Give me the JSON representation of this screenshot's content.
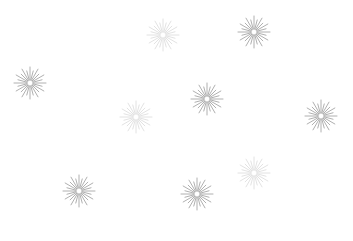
{
  "canvas": {
    "width": 353,
    "height": 241,
    "background": "#ffffff"
  },
  "starbursts": [
    {
      "id": "starburst-1",
      "cx": 30,
      "cy": 83,
      "r": 16,
      "inner": 3,
      "rays": 24,
      "color": "#8a8a8a",
      "opacity": 0.85
    },
    {
      "id": "starburst-2",
      "cx": 163,
      "cy": 35,
      "r": 16,
      "inner": 3,
      "rays": 24,
      "color": "#b0b0b0",
      "opacity": 0.45
    },
    {
      "id": "starburst-3",
      "cx": 254,
      "cy": 32,
      "r": 16,
      "inner": 3,
      "rays": 24,
      "color": "#8a8a8a",
      "opacity": 0.85
    },
    {
      "id": "starburst-4",
      "cx": 207,
      "cy": 99,
      "r": 16,
      "inner": 3,
      "rays": 24,
      "color": "#8a8a8a",
      "opacity": 0.85
    },
    {
      "id": "starburst-5",
      "cx": 136,
      "cy": 117,
      "r": 16,
      "inner": 3,
      "rays": 24,
      "color": "#b0b0b0",
      "opacity": 0.45
    },
    {
      "id": "starburst-6",
      "cx": 321,
      "cy": 116,
      "r": 16,
      "inner": 3,
      "rays": 24,
      "color": "#8a8a8a",
      "opacity": 0.85
    },
    {
      "id": "starburst-7",
      "cx": 254,
      "cy": 173,
      "r": 16,
      "inner": 3,
      "rays": 24,
      "color": "#b0b0b0",
      "opacity": 0.45
    },
    {
      "id": "starburst-8",
      "cx": 79,
      "cy": 191,
      "r": 16,
      "inner": 3,
      "rays": 24,
      "color": "#8a8a8a",
      "opacity": 0.85
    },
    {
      "id": "starburst-9",
      "cx": 197,
      "cy": 194,
      "r": 16,
      "inner": 3,
      "rays": 24,
      "color": "#8a8a8a",
      "opacity": 0.85
    }
  ]
}
